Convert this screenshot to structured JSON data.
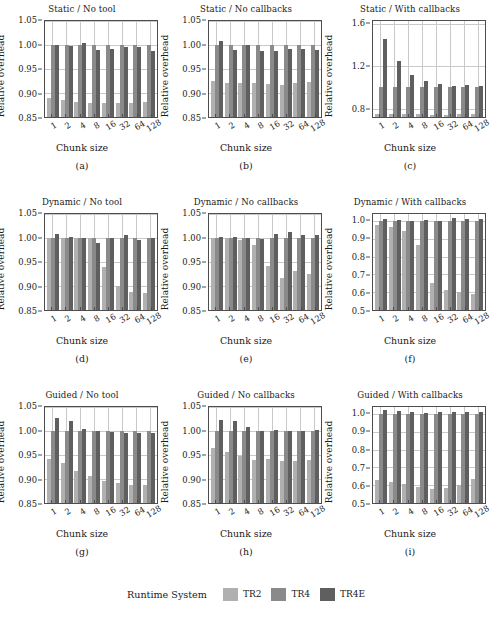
{
  "figure": {
    "xlabel": "Chunk size",
    "ylabel": "Relative overhead",
    "categories": [
      "1",
      "2",
      "4",
      "8",
      "16",
      "32",
      "64",
      "128"
    ]
  },
  "legend": {
    "title": "Runtime System",
    "items": [
      {
        "label": "TR2",
        "color": "#b0b0b0"
      },
      {
        "label": "TR4",
        "color": "#8a8a8a"
      },
      {
        "label": "TR4E",
        "color": "#5f5f5f"
      }
    ]
  },
  "chart_data": [
    {
      "type": "bar",
      "panel": "a",
      "title": "Static / No tool",
      "caption": "(a)",
      "xlabel": "Chunk size",
      "ylabel": "Relative overhead",
      "categories": [
        "1",
        "2",
        "4",
        "8",
        "16",
        "32",
        "64",
        "128"
      ],
      "ylim": [
        0.85,
        1.05
      ],
      "yticks": [
        0.85,
        0.9,
        0.95,
        1.0,
        1.05
      ],
      "ytick_labels": [
        "0.85",
        "0.90",
        "0.95",
        "1.00",
        "1.05"
      ],
      "grid": true,
      "series": [
        {
          "name": "TR2",
          "values": [
            0.889,
            0.885,
            0.882,
            0.88,
            0.879,
            0.88,
            0.88,
            0.881
          ]
        },
        {
          "name": "TR4",
          "values": [
            1.0,
            1.0,
            1.0,
            1.0,
            1.0,
            1.0,
            1.0,
            1.0
          ]
        },
        {
          "name": "TR4E",
          "values": [
            1.001,
            0.998,
            1.005,
            0.99,
            0.992,
            0.995,
            0.996,
            0.988
          ]
        }
      ]
    },
    {
      "type": "bar",
      "panel": "b",
      "title": "Static / No callbacks",
      "caption": "(b)",
      "xlabel": "Chunk size",
      "ylabel": "Relative overhead",
      "categories": [
        "1",
        "2",
        "4",
        "8",
        "16",
        "32",
        "64",
        "128"
      ],
      "ylim": [
        0.85,
        1.05
      ],
      "yticks": [
        0.85,
        0.9,
        0.95,
        1.0,
        1.05
      ],
      "ytick_labels": [
        "0.85",
        "0.90",
        "0.95",
        "1.00",
        "1.05"
      ],
      "grid": true,
      "series": [
        {
          "name": "TR2",
          "values": [
            0.926,
            0.921,
            0.921,
            0.92,
            0.919,
            0.917,
            0.921,
            0.923
          ]
        },
        {
          "name": "TR4",
          "values": [
            1.0,
            1.0,
            1.0,
            1.0,
            1.0,
            1.0,
            1.0,
            1.0
          ]
        },
        {
          "name": "TR4E",
          "values": [
            1.008,
            0.99,
            1.001,
            0.988,
            0.988,
            0.991,
            0.991,
            0.989
          ]
        }
      ]
    },
    {
      "type": "bar",
      "panel": "c",
      "title": "Static / With callbacks",
      "caption": "(c)",
      "xlabel": "Chunk size",
      "ylabel": "Relative overhead",
      "categories": [
        "1",
        "2",
        "4",
        "8",
        "16",
        "32",
        "64",
        "128"
      ],
      "ylim": [
        0.72,
        1.63
      ],
      "yticks": [
        0.8,
        1.2,
        1.6
      ],
      "ytick_labels": [
        "0.8",
        "1.2",
        "1.6"
      ],
      "grid": true,
      "series": [
        {
          "name": "TR2",
          "values": [
            0.745,
            0.745,
            0.744,
            0.744,
            0.743,
            0.743,
            0.744,
            0.744
          ]
        },
        {
          "name": "TR4",
          "values": [
            1.0,
            1.0,
            1.0,
            1.0,
            1.0,
            1.0,
            1.0,
            1.0
          ]
        },
        {
          "name": "TR4E",
          "values": [
            1.455,
            1.25,
            1.118,
            1.063,
            1.032,
            1.018,
            1.02,
            1.01
          ]
        }
      ]
    },
    {
      "type": "bar",
      "panel": "d",
      "title": "Dynamic / No tool",
      "caption": "(d)",
      "xlabel": "Chunk size",
      "ylabel": "Relative overhead",
      "categories": [
        "1",
        "2",
        "4",
        "8",
        "16",
        "32",
        "64",
        "128"
      ],
      "ylim": [
        0.85,
        1.05
      ],
      "yticks": [
        0.85,
        0.9,
        0.95,
        1.0,
        1.05
      ],
      "ytick_labels": [
        "0.85",
        "0.90",
        "0.95",
        "1.00",
        "1.05"
      ],
      "grid": true,
      "series": [
        {
          "name": "TR2",
          "values": [
            1.0,
            1.001,
            1.0,
            1.0,
            0.94,
            0.9,
            0.888,
            0.885
          ]
        },
        {
          "name": "TR4",
          "values": [
            1.0,
            1.0,
            1.0,
            1.0,
            1.0,
            1.0,
            1.0,
            1.0
          ]
        },
        {
          "name": "TR4E",
          "values": [
            1.008,
            1.003,
            0.999,
            0.989,
            1.0,
            1.006,
            0.996,
            1.0
          ]
        }
      ]
    },
    {
      "type": "bar",
      "panel": "e",
      "title": "Dynamic / No callbacks",
      "caption": "(e)",
      "xlabel": "Chunk size",
      "ylabel": "Relative overhead",
      "categories": [
        "1",
        "2",
        "4",
        "8",
        "16",
        "32",
        "64",
        "128"
      ],
      "ylim": [
        0.85,
        1.05
      ],
      "yticks": [
        0.85,
        0.9,
        0.95,
        1.0,
        1.05
      ],
      "ytick_labels": [
        "0.85",
        "0.90",
        "0.95",
        "1.00",
        "1.05"
      ],
      "grid": true,
      "series": [
        {
          "name": "TR2",
          "values": [
            0.999,
            0.999,
            0.996,
            0.985,
            0.941,
            0.917,
            0.931,
            0.924
          ]
        },
        {
          "name": "TR4",
          "values": [
            1.0,
            1.0,
            1.0,
            1.0,
            1.0,
            1.0,
            1.0,
            1.0
          ]
        },
        {
          "name": "TR4E",
          "values": [
            1.002,
            1.003,
            1.001,
            0.998,
            1.008,
            1.012,
            1.006,
            1.006
          ]
        }
      ]
    },
    {
      "type": "bar",
      "panel": "f",
      "title": "Dynamic / With callbacks",
      "caption": "(f)",
      "xlabel": "Chunk size",
      "ylabel": "Relative overhead",
      "categories": [
        "1",
        "2",
        "4",
        "8",
        "16",
        "32",
        "64",
        "128"
      ],
      "ylim": [
        0.5,
        1.04
      ],
      "yticks": [
        0.5,
        0.6,
        0.7,
        0.8,
        0.9,
        1.0
      ],
      "ytick_labels": [
        "0.5",
        "0.6",
        "0.7",
        "0.8",
        "0.9",
        "1.0"
      ],
      "grid": true,
      "series": [
        {
          "name": "TR2",
          "values": [
            0.977,
            0.967,
            0.946,
            0.868,
            0.652,
            0.611,
            0.603,
            0.588
          ]
        },
        {
          "name": "TR4",
          "values": [
            1.0,
            1.0,
            1.0,
            1.0,
            1.0,
            1.0,
            1.0,
            1.0
          ]
        },
        {
          "name": "TR4E",
          "values": [
            1.013,
            1.004,
            1.003,
            1.004,
            1.003,
            1.02,
            1.014,
            1.012
          ]
        }
      ]
    },
    {
      "type": "bar",
      "panel": "g",
      "title": "Guided / No tool",
      "caption": "(g)",
      "xlabel": "Chunk size",
      "ylabel": "Relative overhead",
      "categories": [
        "1",
        "2",
        "4",
        "8",
        "16",
        "32",
        "64",
        "128"
      ],
      "ylim": [
        0.85,
        1.05
      ],
      "yticks": [
        0.85,
        0.9,
        0.95,
        1.0,
        1.05
      ],
      "ytick_labels": [
        "0.85",
        "0.90",
        "0.95",
        "1.00",
        "1.05"
      ],
      "grid": true,
      "series": [
        {
          "name": "TR2",
          "values": [
            0.941,
            0.934,
            0.917,
            0.906,
            0.896,
            0.891,
            0.888,
            0.888
          ]
        },
        {
          "name": "TR4",
          "values": [
            1.0,
            1.0,
            1.0,
            1.0,
            1.0,
            1.0,
            1.0,
            1.0
          ]
        },
        {
          "name": "TR4E",
          "values": [
            1.028,
            1.02,
            1.004,
            0.999,
            0.997,
            0.996,
            0.996,
            0.996
          ]
        }
      ]
    },
    {
      "type": "bar",
      "panel": "h",
      "title": "Guided / No callbacks",
      "caption": "(h)",
      "xlabel": "Chunk size",
      "ylabel": "Relative overhead",
      "categories": [
        "1",
        "2",
        "4",
        "8",
        "16",
        "32",
        "64",
        "128"
      ],
      "ylim": [
        0.85,
        1.05
      ],
      "yticks": [
        0.85,
        0.9,
        0.95,
        1.0,
        1.05
      ],
      "ytick_labels": [
        "0.85",
        "0.90",
        "0.95",
        "1.00",
        "1.05"
      ],
      "grid": true,
      "series": [
        {
          "name": "TR2",
          "values": [
            0.965,
            0.957,
            0.947,
            0.939,
            0.942,
            0.938,
            0.937,
            0.939
          ]
        },
        {
          "name": "TR4",
          "values": [
            1.0,
            1.0,
            1.0,
            1.0,
            1.0,
            1.0,
            1.0,
            1.0
          ]
        },
        {
          "name": "TR4E",
          "values": [
            1.023,
            1.021,
            1.008,
            1.0,
            1.002,
            1.0,
            1.001,
            1.003
          ]
        }
      ]
    },
    {
      "type": "bar",
      "panel": "i",
      "title": "Guided / With callbacks",
      "caption": "(i)",
      "xlabel": "Chunk size",
      "ylabel": "Relative overhead",
      "categories": [
        "1",
        "2",
        "4",
        "8",
        "16",
        "32",
        "64",
        "128"
      ],
      "ylim": [
        0.5,
        1.04
      ],
      "yticks": [
        0.5,
        0.6,
        0.7,
        0.8,
        0.9,
        1.0
      ],
      "ytick_labels": [
        "0.5",
        "0.6",
        "0.7",
        "0.8",
        "0.9",
        "1.0"
      ],
      "grid": true,
      "series": [
        {
          "name": "TR2",
          "values": [
            0.63,
            0.616,
            0.605,
            0.589,
            0.58,
            0.586,
            0.602,
            0.636
          ]
        },
        {
          "name": "TR4",
          "values": [
            1.0,
            1.0,
            1.0,
            1.0,
            1.0,
            1.0,
            1.0,
            1.0
          ]
        },
        {
          "name": "TR4E",
          "values": [
            1.022,
            1.02,
            1.01,
            1.008,
            1.01,
            1.012,
            1.012,
            1.012
          ]
        }
      ]
    }
  ]
}
